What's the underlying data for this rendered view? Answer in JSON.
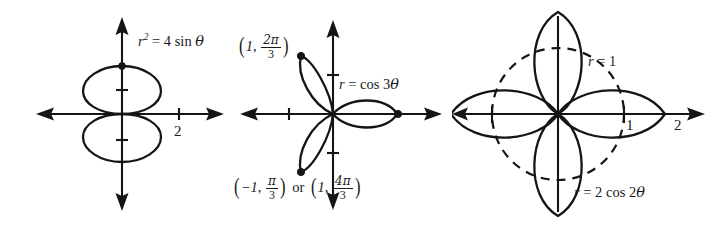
{
  "figure": {
    "background_color": "#ffffff",
    "ink_color": "#151515",
    "panels": [
      {
        "id": "lemniscate",
        "name": "figure-eight-lemniscate",
        "equation_label": "r2 = 4 sin θ",
        "equation_parts": {
          "var": "r",
          "exponent": "2",
          "rhs": "= 4 sin",
          "angle": "θ"
        },
        "axis_tick_labels": [
          "2"
        ],
        "markers": [
          "top-of-upper-loop"
        ],
        "chart_type": "polar",
        "curve": {
          "type": "lemniscate",
          "formula": "r^2 = 4 sin(theta)",
          "a": 2
        }
      },
      {
        "id": "rose3",
        "name": "three-petal-rose",
        "equation_label": "r = cos 3θ",
        "equation_parts": {
          "var": "r",
          "rhs": "= cos 3",
          "angle": "θ"
        },
        "axis_tick_labels": [
          ""
        ],
        "point_label_top": {
          "r": "1",
          "theta_num": "2π",
          "theta_den": "3"
        },
        "point_label_bottom_a": {
          "r": "−1",
          "theta_num": "π",
          "theta_den": "3"
        },
        "point_label_bottom_or": "or",
        "point_label_bottom_b": {
          "r": "1",
          "theta_num": "4π",
          "theta_den": "3"
        },
        "chart_type": "polar",
        "curve": {
          "type": "rose",
          "formula": "r = cos(3 theta)",
          "petals": 3,
          "amplitude": 1
        }
      },
      {
        "id": "rose4",
        "name": "four-petal-rose-with-unit-circle",
        "equation_label": "r = 2 cos 2θ",
        "equation_parts": {
          "var": "r",
          "rhs": "= 2 cos 2",
          "angle": "θ"
        },
        "circle_label": "r = 1",
        "circle_label_parts": {
          "var": "r",
          "rhs": "= 1"
        },
        "axis_tick_labels": [
          "1",
          "2"
        ],
        "chart_type": "polar",
        "curve": {
          "type": "rose",
          "formula": "r = 2 cos(2 theta)",
          "petals": 4,
          "amplitude": 2
        },
        "reference_circle": {
          "type": "circle",
          "formula": "r = 1",
          "radius": 1,
          "style": "dashed"
        }
      }
    ]
  }
}
